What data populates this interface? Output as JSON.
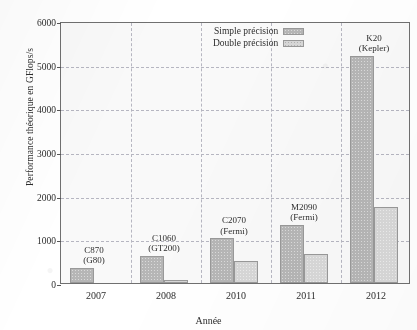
{
  "chart_data": {
    "type": "bar",
    "title": "",
    "xlabel": "Année",
    "ylabel": "Performance théorique en GFlops/s",
    "categories": [
      "2007",
      "2008",
      "2010",
      "2011",
      "2012"
    ],
    "ylim": [
      0,
      6000
    ],
    "yticks": [
      0,
      1000,
      2000,
      3000,
      4000,
      5000,
      6000
    ],
    "ytick_labels": [
      "0",
      "1000",
      "2000",
      "3000",
      "4000",
      "5000",
      "6000"
    ],
    "grid": true,
    "legend_position": "top-center",
    "series": [
      {
        "name": "Simple précision",
        "color": "#b9b9b9",
        "values": [
          345,
          622,
          1030,
          1331,
          5200
        ]
      },
      {
        "name": "Double précision",
        "color": "#dcdcdc",
        "values": [
          0,
          78,
          515,
          665,
          1750
        ]
      }
    ],
    "annotations": [
      {
        "category": "2007",
        "line1": "C870",
        "line2": "(G80)"
      },
      {
        "category": "2008",
        "line1": "C1060",
        "line2": "(GT200)"
      },
      {
        "category": "2010",
        "line1": "C2070",
        "line2": "(Fermi)"
      },
      {
        "category": "2011",
        "line1": "M2090",
        "line2": "(Fermi)"
      },
      {
        "category": "2012",
        "line1": "K20",
        "line2": "(Kepler)"
      }
    ]
  },
  "legend": {
    "items": [
      {
        "label": "Simple précision"
      },
      {
        "label": "Double précision"
      }
    ]
  }
}
